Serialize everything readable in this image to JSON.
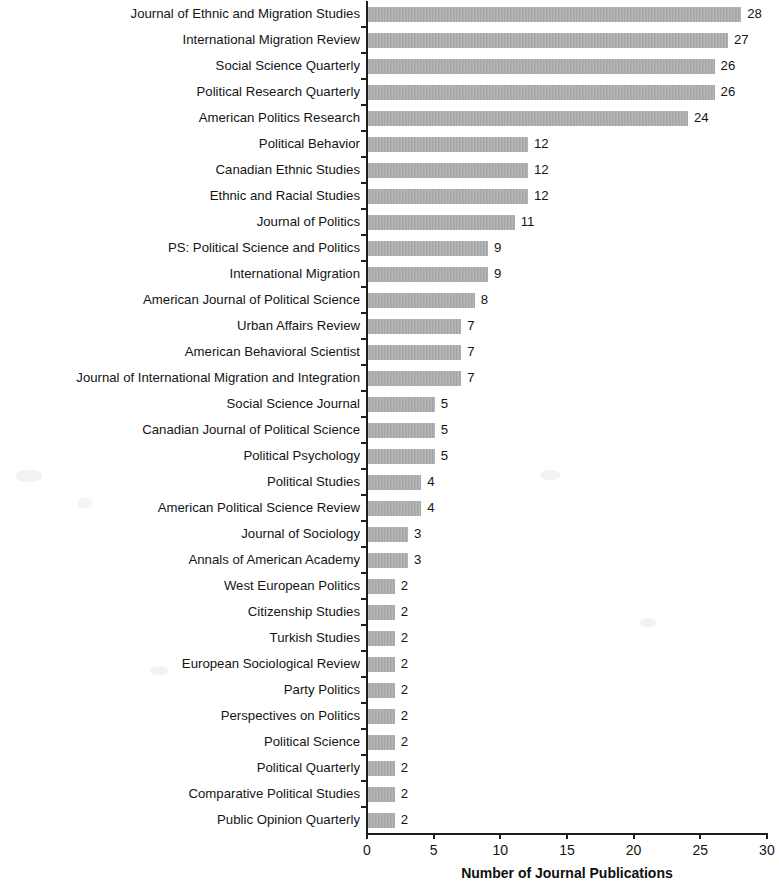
{
  "chart_data": {
    "type": "bar",
    "orientation": "horizontal",
    "title": "",
    "xlabel": "Number of Journal Publications",
    "ylabel": "",
    "xlim": [
      0,
      30
    ],
    "xticks": [
      0,
      5,
      10,
      15,
      20,
      25,
      30
    ],
    "grid": false,
    "legend": null,
    "bar_color": "#a9a9a9",
    "axis_color": "#1e1e1e",
    "value_labels_shown": true,
    "categories": [
      "Journal of Ethnic and Migration Studies",
      "International Migration Review",
      "Social Science Quarterly",
      "Political Research Quarterly",
      "American Politics Research",
      "Political Behavior",
      "Canadian Ethnic Studies",
      "Ethnic and Racial Studies",
      "Journal of Politics",
      "PS: Political Science and Politics",
      "International Migration",
      "American Journal of Political Science",
      "Urban Affairs Review",
      "American Behavioral Scientist",
      "Journal of International Migration and Integration",
      "Social Science Journal",
      "Canadian Journal of Political Science",
      "Political Psychology",
      "Political Studies",
      "American Political Science Review",
      "Journal of Sociology",
      "Annals of American Academy",
      "West European Politics",
      "Citizenship Studies",
      "Turkish Studies",
      "European Sociological Review",
      "Party Politics",
      "Perspectives on Politics",
      "Political Science",
      "Political Quarterly",
      "Comparative Political Studies",
      "Public Opinion Quarterly"
    ],
    "values": [
      28,
      27,
      26,
      26,
      24,
      12,
      12,
      12,
      11,
      9,
      9,
      8,
      7,
      7,
      7,
      5,
      5,
      5,
      4,
      4,
      3,
      3,
      2,
      2,
      2,
      2,
      2,
      2,
      2,
      2,
      2,
      2
    ]
  }
}
